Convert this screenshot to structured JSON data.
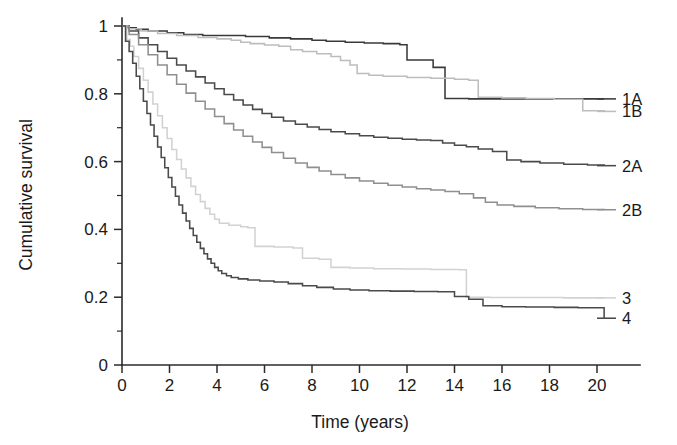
{
  "chart_data": {
    "type": "line",
    "title": "",
    "subtitle": "",
    "xlabel": "Time (years)",
    "ylabel": "Cumulative survival",
    "xlim": [
      0,
      20.6
    ],
    "ylim": [
      0,
      1.02
    ],
    "xticks": [
      0,
      2,
      4,
      6,
      8,
      10,
      12,
      14,
      16,
      18,
      20
    ],
    "xtick_labels": [
      "0",
      "2",
      "4",
      "6",
      "8",
      "10",
      "12",
      "14",
      "16",
      "18",
      "20"
    ],
    "yticks": [
      0,
      0.2,
      0.4,
      0.6,
      0.8,
      1
    ],
    "ytick_labels": [
      "0",
      "0.2",
      "0.4",
      "0.6",
      "0.8",
      "1"
    ],
    "y_minor_ticks": [
      0.1,
      0.3,
      0.5,
      0.7,
      0.9
    ],
    "grid": false,
    "legend_position": "right-inline",
    "curve_style": "step-post",
    "series": [
      {
        "name": "1A",
        "label": "1A",
        "color": "#3a3a3a",
        "label_y": 0.785,
        "final_value": 0.785,
        "points": [
          [
            0,
            1.0
          ],
          [
            0.25,
            0.995
          ],
          [
            0.6,
            0.99
          ],
          [
            1.1,
            0.985
          ],
          [
            1.9,
            0.98
          ],
          [
            2.6,
            0.975
          ],
          [
            3.4,
            0.972
          ],
          [
            4.3,
            0.972
          ],
          [
            5.2,
            0.969
          ],
          [
            6.2,
            0.965
          ],
          [
            7.1,
            0.962
          ],
          [
            8.0,
            0.958
          ],
          [
            8.6,
            0.955
          ],
          [
            9.4,
            0.952
          ],
          [
            10.2,
            0.95
          ],
          [
            11.0,
            0.948
          ],
          [
            11.7,
            0.945
          ],
          [
            12.0,
            0.9
          ],
          [
            12.6,
            0.9
          ],
          [
            13.1,
            0.878
          ],
          [
            13.5,
            0.878
          ],
          [
            13.6,
            0.786
          ],
          [
            14.6,
            0.785
          ],
          [
            16.0,
            0.785
          ],
          [
            18.0,
            0.785
          ],
          [
            20.3,
            0.785
          ]
        ]
      },
      {
        "name": "1B",
        "label": "1B",
        "color": "#bdbdbd",
        "label_y": 0.748,
        "final_value": 0.748,
        "points": [
          [
            0,
            1.0
          ],
          [
            0.3,
            0.992
          ],
          [
            0.8,
            0.985
          ],
          [
            1.5,
            0.978
          ],
          [
            2.3,
            0.972
          ],
          [
            3.2,
            0.966
          ],
          [
            4.0,
            0.962
          ],
          [
            4.6,
            0.958
          ],
          [
            5.0,
            0.952
          ],
          [
            5.4,
            0.948
          ],
          [
            6.0,
            0.944
          ],
          [
            6.6,
            0.94
          ],
          [
            7.1,
            0.93
          ],
          [
            7.6,
            0.925
          ],
          [
            8.2,
            0.918
          ],
          [
            8.8,
            0.91
          ],
          [
            9.2,
            0.898
          ],
          [
            9.6,
            0.885
          ],
          [
            9.9,
            0.86
          ],
          [
            10.4,
            0.855
          ],
          [
            11.0,
            0.852
          ],
          [
            12.0,
            0.848
          ],
          [
            13.0,
            0.846
          ],
          [
            14.0,
            0.843
          ],
          [
            14.6,
            0.84
          ],
          [
            15.0,
            0.79
          ],
          [
            16.0,
            0.788
          ],
          [
            17.0,
            0.786
          ],
          [
            18.2,
            0.784
          ],
          [
            19.4,
            0.75
          ],
          [
            20.3,
            0.748
          ]
        ]
      },
      {
        "name": "2A",
        "label": "2A",
        "color": "#4a4a4a",
        "label_y": 0.588,
        "final_value": 0.588,
        "points": [
          [
            0,
            1.0
          ],
          [
            0.3,
            0.985
          ],
          [
            0.7,
            0.965
          ],
          [
            1.1,
            0.945
          ],
          [
            1.5,
            0.925
          ],
          [
            1.9,
            0.905
          ],
          [
            2.3,
            0.885
          ],
          [
            2.7,
            0.867
          ],
          [
            3.1,
            0.85
          ],
          [
            3.5,
            0.832
          ],
          [
            3.9,
            0.815
          ],
          [
            4.3,
            0.798
          ],
          [
            4.7,
            0.782
          ],
          [
            5.1,
            0.767
          ],
          [
            5.5,
            0.754
          ],
          [
            5.9,
            0.742
          ],
          [
            6.3,
            0.731
          ],
          [
            6.8,
            0.72
          ],
          [
            7.3,
            0.71
          ],
          [
            7.8,
            0.702
          ],
          [
            8.3,
            0.695
          ],
          [
            8.8,
            0.688
          ],
          [
            9.4,
            0.682
          ],
          [
            10.0,
            0.676
          ],
          [
            10.6,
            0.672
          ],
          [
            11.2,
            0.669
          ],
          [
            11.8,
            0.666
          ],
          [
            12.4,
            0.664
          ],
          [
            13.0,
            0.662
          ],
          [
            13.5,
            0.655
          ],
          [
            14.0,
            0.648
          ],
          [
            14.5,
            0.644
          ],
          [
            15.0,
            0.637
          ],
          [
            15.6,
            0.63
          ],
          [
            16.2,
            0.605
          ],
          [
            16.8,
            0.6
          ],
          [
            17.6,
            0.596
          ],
          [
            18.6,
            0.592
          ],
          [
            19.6,
            0.59
          ],
          [
            20.3,
            0.588
          ]
        ]
      },
      {
        "name": "2B",
        "label": "2B",
        "color": "#8f8f8f",
        "label_y": 0.458,
        "final_value": 0.458,
        "points": [
          [
            0,
            1.0
          ],
          [
            0.3,
            0.975
          ],
          [
            0.7,
            0.945
          ],
          [
            1.1,
            0.915
          ],
          [
            1.5,
            0.885
          ],
          [
            1.9,
            0.856
          ],
          [
            2.3,
            0.828
          ],
          [
            2.7,
            0.802
          ],
          [
            3.1,
            0.778
          ],
          [
            3.5,
            0.755
          ],
          [
            3.9,
            0.733
          ],
          [
            4.3,
            0.712
          ],
          [
            4.7,
            0.693
          ],
          [
            5.1,
            0.675
          ],
          [
            5.5,
            0.658
          ],
          [
            5.9,
            0.642
          ],
          [
            6.3,
            0.627
          ],
          [
            6.8,
            0.61
          ],
          [
            7.3,
            0.596
          ],
          [
            7.8,
            0.583
          ],
          [
            8.3,
            0.572
          ],
          [
            8.8,
            0.562
          ],
          [
            9.4,
            0.552
          ],
          [
            10.0,
            0.543
          ],
          [
            10.6,
            0.536
          ],
          [
            11.2,
            0.53
          ],
          [
            11.8,
            0.525
          ],
          [
            12.4,
            0.52
          ],
          [
            13.0,
            0.516
          ],
          [
            13.6,
            0.512
          ],
          [
            14.2,
            0.505
          ],
          [
            14.8,
            0.493
          ],
          [
            15.3,
            0.48
          ],
          [
            15.8,
            0.472
          ],
          [
            16.5,
            0.468
          ],
          [
            17.4,
            0.464
          ],
          [
            18.4,
            0.461
          ],
          [
            19.4,
            0.459
          ],
          [
            20.3,
            0.458
          ]
        ]
      },
      {
        "name": "3",
        "label": "3",
        "color": "#d2d2d2",
        "label_y": 0.198,
        "final_value": 0.198,
        "points": [
          [
            0,
            1.0
          ],
          [
            0.2,
            0.96
          ],
          [
            0.35,
            0.94
          ],
          [
            0.5,
            0.91
          ],
          [
            0.7,
            0.875
          ],
          [
            0.9,
            0.84
          ],
          [
            1.1,
            0.805
          ],
          [
            1.3,
            0.77
          ],
          [
            1.5,
            0.735
          ],
          [
            1.7,
            0.7
          ],
          [
            1.9,
            0.668
          ],
          [
            2.1,
            0.636
          ],
          [
            2.3,
            0.606
          ],
          [
            2.5,
            0.578
          ],
          [
            2.7,
            0.552
          ],
          [
            2.9,
            0.527
          ],
          [
            3.1,
            0.503
          ],
          [
            3.3,
            0.482
          ],
          [
            3.5,
            0.462
          ],
          [
            3.7,
            0.445
          ],
          [
            3.9,
            0.43
          ],
          [
            4.1,
            0.418
          ],
          [
            4.5,
            0.412
          ],
          [
            5.0,
            0.408
          ],
          [
            5.3,
            0.405
          ],
          [
            5.6,
            0.35
          ],
          [
            6.4,
            0.348
          ],
          [
            7.2,
            0.345
          ],
          [
            7.6,
            0.315
          ],
          [
            8.3,
            0.312
          ],
          [
            8.8,
            0.288
          ],
          [
            9.6,
            0.286
          ],
          [
            10.6,
            0.284
          ],
          [
            11.8,
            0.283
          ],
          [
            13.0,
            0.282
          ],
          [
            14.2,
            0.281
          ],
          [
            14.5,
            0.2
          ],
          [
            15.5,
            0.199
          ],
          [
            17.0,
            0.199
          ],
          [
            18.6,
            0.198
          ],
          [
            20.3,
            0.198
          ]
        ]
      },
      {
        "name": "4",
        "label": "4",
        "color": "#4a4a4a",
        "label_y": 0.138,
        "final_value": 0.138,
        "points": [
          [
            0,
            1.0
          ],
          [
            0.15,
            0.955
          ],
          [
            0.3,
            0.925
          ],
          [
            0.45,
            0.89
          ],
          [
            0.6,
            0.852
          ],
          [
            0.75,
            0.815
          ],
          [
            0.9,
            0.778
          ],
          [
            1.05,
            0.742
          ],
          [
            1.2,
            0.708
          ],
          [
            1.35,
            0.675
          ],
          [
            1.5,
            0.643
          ],
          [
            1.65,
            0.612
          ],
          [
            1.8,
            0.582
          ],
          [
            1.95,
            0.553
          ],
          [
            2.1,
            0.525
          ],
          [
            2.25,
            0.498
          ],
          [
            2.4,
            0.472
          ],
          [
            2.55,
            0.448
          ],
          [
            2.7,
            0.425
          ],
          [
            2.85,
            0.403
          ],
          [
            3.0,
            0.382
          ],
          [
            3.15,
            0.362
          ],
          [
            3.3,
            0.344
          ],
          [
            3.45,
            0.328
          ],
          [
            3.6,
            0.313
          ],
          [
            3.75,
            0.3
          ],
          [
            3.9,
            0.288
          ],
          [
            4.05,
            0.278
          ],
          [
            4.2,
            0.27
          ],
          [
            4.4,
            0.263
          ],
          [
            4.6,
            0.258
          ],
          [
            4.9,
            0.254
          ],
          [
            5.3,
            0.251
          ],
          [
            5.8,
            0.248
          ],
          [
            6.4,
            0.245
          ],
          [
            7.0,
            0.24
          ],
          [
            7.6,
            0.234
          ],
          [
            8.2,
            0.229
          ],
          [
            8.9,
            0.224
          ],
          [
            9.6,
            0.221
          ],
          [
            10.4,
            0.219
          ],
          [
            11.3,
            0.218
          ],
          [
            12.3,
            0.217
          ],
          [
            13.3,
            0.216
          ],
          [
            14.0,
            0.202
          ],
          [
            14.6,
            0.194
          ],
          [
            15.2,
            0.175
          ],
          [
            16.0,
            0.172
          ],
          [
            17.0,
            0.171
          ],
          [
            18.2,
            0.17
          ],
          [
            19.2,
            0.169
          ],
          [
            20.3,
            0.138
          ]
        ]
      }
    ]
  },
  "axes": {
    "x_label": "Time (years)",
    "y_label": "Cumulative survival"
  }
}
